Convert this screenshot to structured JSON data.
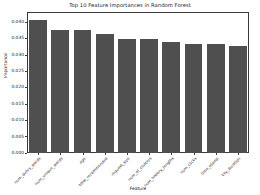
{
  "chart_data": {
    "type": "bar",
    "title": "Top 10 Feature Importances in Random Forest",
    "xlabel": "Feature",
    "ylabel": "Importance",
    "categories": [
      "num_query_words",
      "num_unique_words",
      "age",
      "total_recommended",
      "request_size",
      "num_of_clusters",
      "num_history_lengths",
      "num_clicks",
      "time_stamp",
      "key_duration"
    ],
    "values": [
      0.0407,
      0.0375,
      0.0375,
      0.0365,
      0.035,
      0.0347,
      0.034,
      0.0334,
      0.0334,
      0.0328
    ],
    "ytick_labels": [
      "0.000",
      "0.005",
      "0.010",
      "0.015",
      "0.020",
      "0.025",
      "0.030",
      "0.035",
      "0.040"
    ],
    "ytick_values": [
      0.0,
      0.005,
      0.01,
      0.015,
      0.02,
      0.025,
      0.03,
      0.035,
      0.04
    ],
    "ylim": [
      0.0,
      0.0431
    ],
    "grid": false,
    "legend": false,
    "bar_color": "#4f4f4f",
    "axis_color": "#3a3a3a",
    "background": "#ffffff"
  }
}
